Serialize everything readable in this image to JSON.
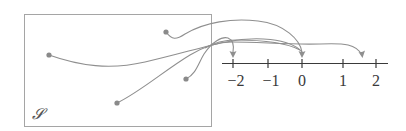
{
  "diagram": {
    "set_label": "𝓢",
    "colors": {
      "box": "#9a9a9a",
      "curve": "#8f8f8f",
      "dot": "#8a8a8a",
      "axis": "#3a3a3a",
      "text": "#3a3a3a"
    },
    "number_line": {
      "ticks": [
        {
          "value": -2,
          "label": "−2",
          "x": 233
        },
        {
          "value": -1,
          "label": "−1",
          "x": 268
        },
        {
          "value": 0,
          "label": "0",
          "x": 302
        },
        {
          "value": 1,
          "label": "1",
          "x": 343
        },
        {
          "value": 2,
          "label": "2",
          "x": 376
        }
      ]
    },
    "points": [
      {
        "id": "p1",
        "x": 49,
        "y": 55,
        "maps_to": 0
      },
      {
        "id": "p2",
        "x": 166,
        "y": 32,
        "maps_to": 0
      },
      {
        "id": "p3",
        "x": 186,
        "y": 79,
        "maps_to": -2
      },
      {
        "id": "p4",
        "x": 117,
        "y": 103,
        "maps_to": 1.6
      }
    ]
  }
}
